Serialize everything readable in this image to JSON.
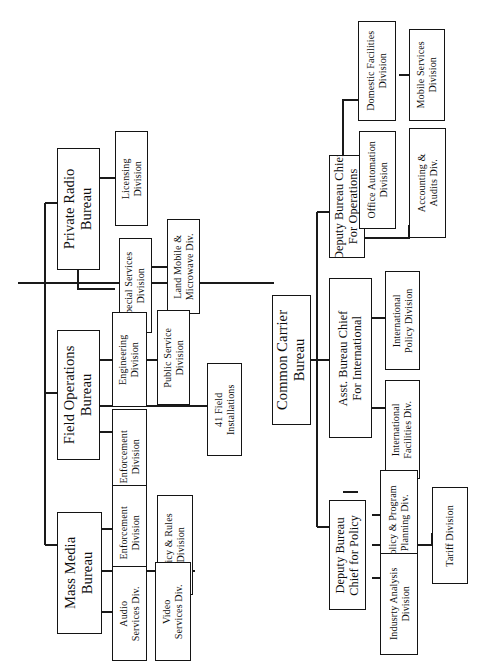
{
  "chart": {
    "type": "organization-chart",
    "orientation": "rotated-90-counterclockwise",
    "root_label": "",
    "nodes": [
      {
        "id": "private-radio-bureau",
        "label": "Private Radio\nBureau",
        "level": "bureau"
      },
      {
        "id": "licensing-division",
        "label": "Licensing\nDivision",
        "level": "division"
      },
      {
        "id": "special-services-division",
        "label": "Special Services\nDivision",
        "level": "division"
      },
      {
        "id": "land-mobile-microwave-div",
        "label": "Land Mobile &\nMicrowave Div.",
        "level": "division"
      },
      {
        "id": "field-operations-bureau",
        "label": "Field Operations\nBureau",
        "level": "bureau"
      },
      {
        "id": "engineering-division",
        "label": "Engineering\nDivision",
        "level": "division"
      },
      {
        "id": "public-service-division",
        "label": "Public Service\nDivision",
        "level": "division"
      },
      {
        "id": "field-enforcement-division",
        "label": "Enforcement\nDivision",
        "level": "division"
      },
      {
        "id": "41-field-installations",
        "label": "41 Field\nInstallations",
        "level": "division"
      },
      {
        "id": "mass-media-bureau",
        "label": "Mass Media\nBureau",
        "level": "bureau"
      },
      {
        "id": "mm-enforcement-division",
        "label": "Enforcement\nDivision",
        "level": "division"
      },
      {
        "id": "audio-services-div",
        "label": "Audio\nServices Div.",
        "level": "division"
      },
      {
        "id": "policy-rules-division",
        "label": "Policy & Rules\nDivision",
        "level": "division"
      },
      {
        "id": "video-services-div",
        "label": "Video\nServices Div.",
        "level": "division"
      },
      {
        "id": "common-carrier-bureau",
        "label": "Common Carrier\nBureau",
        "level": "bureau"
      },
      {
        "id": "deputy-bureau-chief-operations",
        "label": "Deputy Bureau Chief\nFor Operations",
        "level": "chief"
      },
      {
        "id": "domestic-facilities-division",
        "label": "Domestic Facilities\nDivision",
        "level": "division"
      },
      {
        "id": "mobile-services-division",
        "label": "Mobile Services\nDivision",
        "level": "division"
      },
      {
        "id": "office-automation-division",
        "label": "Office Automation\nDivision",
        "level": "division"
      },
      {
        "id": "accounting-audits-div",
        "label": "Accounting &\nAudits Div.",
        "level": "division"
      },
      {
        "id": "asst-bureau-chief-international",
        "label": "Asst. Bureau Chief\nFor International",
        "level": "chief"
      },
      {
        "id": "international-policy-division",
        "label": "International\nPolicy Division",
        "level": "division"
      },
      {
        "id": "international-facilities-div",
        "label": "International\nFacilities Div.",
        "level": "division"
      },
      {
        "id": "deputy-bureau-chief-policy",
        "label": "Deputy Bureau\nChief for Policy",
        "level": "chief"
      },
      {
        "id": "policy-program-planning-div",
        "label": "Policy & Program\nPlanning Div.",
        "level": "division"
      },
      {
        "id": "industry-analysis-division",
        "label": "Indusrty Analysis\nDivision",
        "level": "division"
      },
      {
        "id": "tariff-division",
        "label": "Tariff Division",
        "level": "division"
      }
    ],
    "edges": [
      {
        "from": "root",
        "to": "private-radio-bureau"
      },
      {
        "from": "root",
        "to": "field-operations-bureau"
      },
      {
        "from": "root",
        "to": "mass-media-bureau"
      },
      {
        "from": "root",
        "to": "common-carrier-bureau"
      },
      {
        "from": "private-radio-bureau",
        "to": "licensing-division"
      },
      {
        "from": "private-radio-bureau",
        "to": "special-services-division"
      },
      {
        "from": "special-services-division",
        "to": "land-mobile-microwave-div"
      },
      {
        "from": "field-operations-bureau",
        "to": "engineering-division"
      },
      {
        "from": "engineering-division",
        "to": "public-service-division"
      },
      {
        "from": "field-operations-bureau",
        "to": "field-enforcement-division"
      },
      {
        "from": "field-operations-bureau",
        "to": "41-field-installations"
      },
      {
        "from": "mass-media-bureau",
        "to": "mm-enforcement-division"
      },
      {
        "from": "mass-media-bureau",
        "to": "audio-services-div"
      },
      {
        "from": "mass-media-bureau",
        "to": "policy-rules-division"
      },
      {
        "from": "policy-rules-division",
        "to": "video-services-div"
      },
      {
        "from": "common-carrier-bureau",
        "to": "deputy-bureau-chief-operations"
      },
      {
        "from": "common-carrier-bureau",
        "to": "asst-bureau-chief-international"
      },
      {
        "from": "common-carrier-bureau",
        "to": "deputy-bureau-chief-policy"
      },
      {
        "from": "deputy-bureau-chief-operations",
        "to": "domestic-facilities-division"
      },
      {
        "from": "domestic-facilities-division",
        "to": "mobile-services-division"
      },
      {
        "from": "deputy-bureau-chief-operations",
        "to": "office-automation-division"
      },
      {
        "from": "deputy-bureau-chief-operations",
        "to": "accounting-audits-div"
      },
      {
        "from": "asst-bureau-chief-international",
        "to": "international-policy-division"
      },
      {
        "from": "asst-bureau-chief-international",
        "to": "international-facilities-div"
      },
      {
        "from": "deputy-bureau-chief-policy",
        "to": "policy-program-planning-div"
      },
      {
        "from": "deputy-bureau-chief-policy",
        "to": "industry-analysis-division"
      },
      {
        "from": "deputy-bureau-chief-policy",
        "to": "tariff-division"
      }
    ]
  }
}
